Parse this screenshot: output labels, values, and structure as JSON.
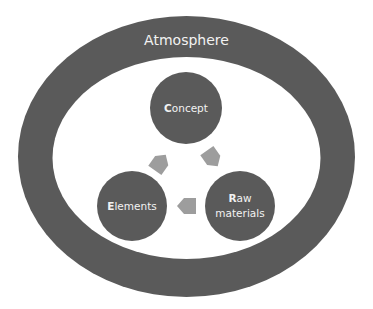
{
  "diagram": {
    "outer": {
      "label": "Atmosphere",
      "color": "#5a5a5a"
    },
    "background_color": "#ffffff",
    "node_color": "#5a5a5a",
    "arrow_color": "#9d9d9d",
    "text_color": "#f2f2f2",
    "nodes": [
      {
        "id": "concept",
        "initial": "C",
        "rest": "oncept",
        "line2": ""
      },
      {
        "id": "raw-materials",
        "initial": "R",
        "rest": "aw",
        "line2": "materials"
      },
      {
        "id": "elements",
        "initial": "E",
        "rest": "lements",
        "line2": ""
      }
    ],
    "cycle": [
      {
        "from": "elements",
        "to": "concept",
        "icon": "arrow-up-right-icon"
      },
      {
        "from": "concept",
        "to": "raw-materials",
        "icon": "arrow-down-right-icon"
      },
      {
        "from": "raw-materials",
        "to": "elements",
        "icon": "arrow-left-icon"
      }
    ]
  }
}
